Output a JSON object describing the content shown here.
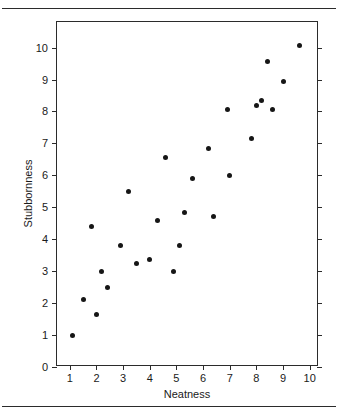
{
  "chart_data": {
    "type": "scatter",
    "title": "",
    "xlabel": "Neatness",
    "ylabel": "Stubbornness",
    "xlim": [
      0.52,
      10.35
    ],
    "ylim": [
      0,
      10.8
    ],
    "xticks": [
      1,
      2,
      3,
      4,
      5,
      6,
      7,
      8,
      9,
      10
    ],
    "yticks": [
      0,
      1,
      2,
      3,
      4,
      5,
      6,
      7,
      8,
      9,
      10
    ],
    "grid": false,
    "legend": null,
    "marker": {
      "shape": "circle",
      "color": "#161616",
      "size": 5
    },
    "n_points": 24,
    "points": [
      {
        "x": 1.1,
        "y": 1.0
      },
      {
        "x": 1.5,
        "y": 2.1
      },
      {
        "x": 1.8,
        "y": 4.4
      },
      {
        "x": 2.0,
        "y": 1.65
      },
      {
        "x": 2.2,
        "y": 3.0
      },
      {
        "x": 2.4,
        "y": 2.5
      },
      {
        "x": 2.9,
        "y": 3.8
      },
      {
        "x": 3.2,
        "y": 5.5
      },
      {
        "x": 3.5,
        "y": 3.25
      },
      {
        "x": 4.0,
        "y": 3.35
      },
      {
        "x": 4.3,
        "y": 4.6
      },
      {
        "x": 4.6,
        "y": 6.55
      },
      {
        "x": 4.9,
        "y": 3.0
      },
      {
        "x": 5.1,
        "y": 3.8
      },
      {
        "x": 5.3,
        "y": 4.85
      },
      {
        "x": 5.6,
        "y": 5.9
      },
      {
        "x": 6.2,
        "y": 6.85
      },
      {
        "x": 6.4,
        "y": 4.7
      },
      {
        "x": 6.9,
        "y": 8.05
      },
      {
        "x": 7.0,
        "y": 6.0
      },
      {
        "x": 7.8,
        "y": 7.15
      },
      {
        "x": 8.0,
        "y": 8.2
      },
      {
        "x": 8.2,
        "y": 8.35
      },
      {
        "x": 8.4,
        "y": 9.55
      },
      {
        "x": 8.6,
        "y": 8.05
      },
      {
        "x": 9.0,
        "y": 8.95
      },
      {
        "x": 9.6,
        "y": 10.05
      }
    ]
  },
  "axes": {
    "x_title": "Neatness",
    "y_title": "Stubbornness",
    "x_tick_labels": [
      "1",
      "2",
      "3",
      "4",
      "5",
      "6",
      "7",
      "8",
      "9",
      "10"
    ],
    "y_tick_labels": [
      "0",
      "1",
      "2",
      "3",
      "4",
      "5",
      "6",
      "7",
      "8",
      "9",
      "10"
    ]
  },
  "style": {
    "frame_color": "#2b2b2b",
    "marker_color": "#161616",
    "background": "#ffffff",
    "rule_color": "#2b2b2b"
  }
}
